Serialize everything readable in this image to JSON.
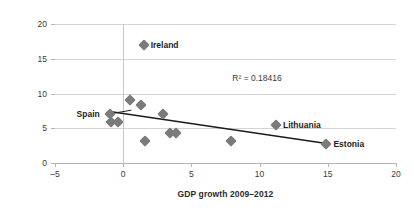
{
  "chart_data": {
    "type": "scatter",
    "title": "",
    "xlabel": "GDP growth 2009–2012",
    "ylabel": "Consolidation volume",
    "xlim": [
      -5,
      20
    ],
    "ylim": [
      0,
      20
    ],
    "xticks": [
      "–5",
      "0",
      "5",
      "10",
      "15",
      "20"
    ],
    "xtick_values": [
      -5,
      0,
      5,
      10,
      15,
      20
    ],
    "yticks": [
      "0",
      "5",
      "10",
      "15",
      "20"
    ],
    "ytick_values": [
      0,
      5,
      10,
      15,
      20
    ],
    "grid": "horizontal",
    "legend": "none",
    "marker_color": "#7b7b7b",
    "marker_shape": "diamond",
    "trendline_color": "#1c1c1c",
    "gridline_color": "#d4d4d4",
    "annotations": [
      {
        "name": "r-squared",
        "text": "R² = 0.18416",
        "x": 8.0,
        "y": 12.3
      }
    ],
    "points": [
      {
        "label": "Spain",
        "x": -1.0,
        "y": 7.0
      },
      {
        "label": "",
        "x": -0.9,
        "y": 5.9
      },
      {
        "label": "",
        "x": -0.4,
        "y": 5.9
      },
      {
        "label": "",
        "x": 0.5,
        "y": 9.1
      },
      {
        "label": "",
        "x": 1.3,
        "y": 8.3
      },
      {
        "label": "",
        "x": 1.6,
        "y": 3.1
      },
      {
        "label": "",
        "x": 2.9,
        "y": 7.1
      },
      {
        "label": "",
        "x": 3.4,
        "y": 4.3
      },
      {
        "label": "",
        "x": 3.9,
        "y": 4.3
      },
      {
        "label": "",
        "x": 7.9,
        "y": 3.1
      },
      {
        "label": "Ireland",
        "x": 1.5,
        "y": 17.0
      },
      {
        "label": "Lithuania",
        "x": 11.2,
        "y": 5.5
      },
      {
        "label": "Estonia",
        "x": 14.9,
        "y": 2.8
      }
    ],
    "point_labels": [
      {
        "name": "ireland",
        "text": "Ireland",
        "anchor": "right"
      },
      {
        "name": "lithuania",
        "text": "Lithuania",
        "anchor": "right"
      },
      {
        "name": "estonia",
        "text": "Estonia",
        "anchor": "right"
      },
      {
        "name": "spain",
        "text": "Spain",
        "anchor": "left"
      }
    ],
    "trendline": {
      "x_start": -1.0,
      "y_start": 7.4,
      "x_end": 14.9,
      "y_end": 2.8
    }
  }
}
